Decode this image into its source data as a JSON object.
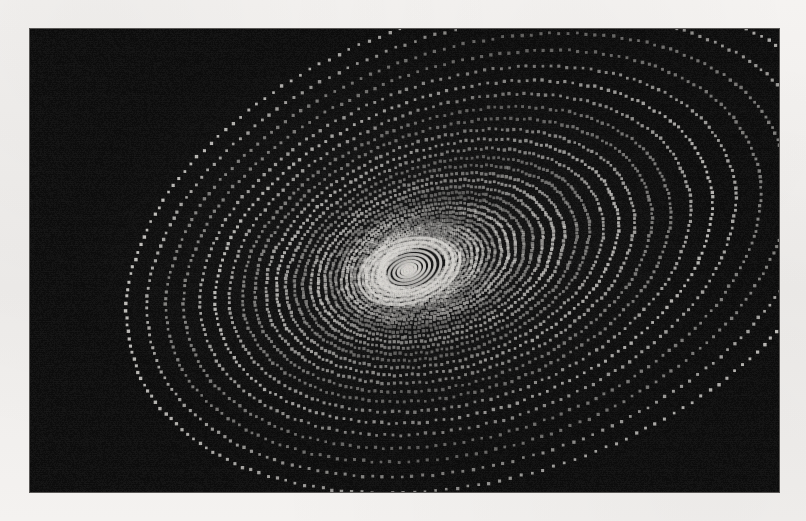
{
  "figure": {
    "title": "Dotted spiral point pattern",
    "caption": "",
    "alt_text": "Dense field of small light dots arranged on nested, tilted elliptical rings that spiral inward toward an off-centre focus on a dark rectangular panel."
  },
  "page": {
    "width": 806,
    "height": 521,
    "background_color": "#f2f0ee",
    "paper_tone": "#f6f4f2"
  },
  "panel": {
    "name": "plot-panel",
    "left": 30,
    "top": 29,
    "width": 749,
    "height": 463,
    "background_color": "#0d0d0d",
    "border_color": "#5a5856",
    "border_width": 1
  },
  "chart_data": {
    "type": "scatter",
    "title": "Dotted spiral point pattern",
    "subtitle": "",
    "xlabel": "",
    "ylabel": "",
    "grid": false,
    "legend": null,
    "tick_labels_x": [],
    "tick_labels_y": [],
    "xlim": [
      0,
      749
    ],
    "ylim": [
      0,
      463
    ],
    "marker": {
      "shape": "square-dot",
      "size_px": 3.1,
      "color": "#d8d6d2",
      "edge_color": "none",
      "min_alpha": 0.14,
      "max_alpha": 0.95
    },
    "generator": {
      "model": "logarithmic-spiral-of-ellipses",
      "description": "Points lie on nested ellipses whose semi-axes shrink geometrically while the ellipse centre drifts toward a common focus, producing dotted spiral arms.",
      "focus_x": 378,
      "focus_y": 241,
      "outer_semi_major": 372,
      "outer_semi_minor": 232,
      "tilt_degrees": -18,
      "ring_count": 34,
      "ring_shrink": 0.928,
      "ring_center_drift": 0.068,
      "points_per_ring_outer": 210,
      "points_per_ring_inner": 96,
      "phase_step_degrees": 7.4,
      "axis_ratio": 0.624,
      "brightness_ripple_period": 5,
      "brightness_ripple_depth": 0.45,
      "radial_falloff": 0.38
    },
    "series": [
      {
        "name": "spiral-dots",
        "color": "#d8d6d2",
        "point_count_estimate": 5200
      }
    ],
    "annotations": [
      {
        "name": "vortex-focus",
        "x": 378,
        "y": 241,
        "label": ""
      }
    ]
  }
}
